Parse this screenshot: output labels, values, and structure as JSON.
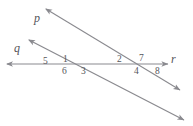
{
  "figure": {
    "type": "geometry-diagram",
    "stroke_color": "#8a8a8f",
    "label_color": "#55555a",
    "background_color": "#ffffff"
  },
  "lines": [
    {
      "id": "line-p",
      "label": "p",
      "label_x": 34,
      "label_y": 12,
      "from_x": 46,
      "from_y": 9,
      "to_x": 180,
      "to_y": 90,
      "arrow_start": true,
      "arrow_end": true
    },
    {
      "id": "line-q",
      "label": "q",
      "label_x": 14,
      "label_y": 42,
      "from_x": 29,
      "from_y": 40,
      "to_x": 184,
      "to_y": 120,
      "arrow_start": true,
      "arrow_end": true
    },
    {
      "id": "line-r",
      "label": "r",
      "label_x": 171,
      "label_y": 53,
      "from_x": 7,
      "from_y": 64,
      "to_x": 168,
      "to_y": 64,
      "arrow_start": true,
      "arrow_end": true
    }
  ],
  "intersections": [
    {
      "id": "intersection-q-r",
      "x": 64,
      "y": 64,
      "lines": [
        "q",
        "r"
      ]
    },
    {
      "id": "intersection-p-r",
      "x": 137,
      "y": 64,
      "lines": [
        "p",
        "r"
      ]
    }
  ],
  "angle_labels": [
    {
      "id": "angle-5",
      "text": "5",
      "x": 43,
      "y": 57
    },
    {
      "id": "angle-1",
      "text": "1",
      "x": 63,
      "y": 55
    },
    {
      "id": "angle-6",
      "text": "6",
      "x": 62,
      "y": 67
    },
    {
      "id": "angle-3",
      "text": "3",
      "x": 81,
      "y": 67
    },
    {
      "id": "angle-2",
      "text": "2",
      "x": 117,
      "y": 55
    },
    {
      "id": "angle-7",
      "text": "7",
      "x": 139,
      "y": 54
    },
    {
      "id": "angle-4",
      "text": "4",
      "x": 134,
      "y": 67
    },
    {
      "id": "angle-8",
      "text": "8",
      "x": 155,
      "y": 67
    }
  ]
}
